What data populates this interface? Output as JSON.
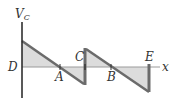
{
  "diagram": {
    "type": "sawtooth voltage waveform",
    "axes": {
      "y_label_main": "V",
      "y_label_sub": "C",
      "x_label": "x"
    },
    "points": {
      "D": "D",
      "A": "A",
      "C": "C",
      "B": "B",
      "E": "E"
    },
    "colors": {
      "line": "#6b6b6b",
      "fill": "#dcdcdc",
      "axis": "#222222",
      "x_axis": "#9a9a9a"
    }
  }
}
